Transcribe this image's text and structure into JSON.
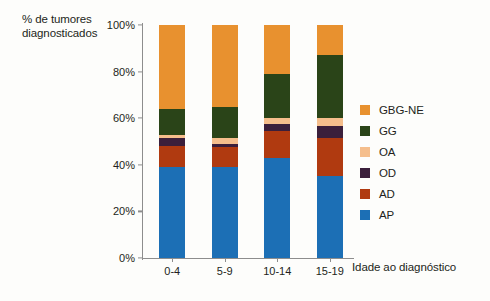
{
  "chart_data": {
    "type": "bar",
    "subtype": "stacked-100-percent",
    "title": "",
    "ylabel": "% de tumores diagnosticados",
    "xlabel": "Idade ao diagnóstico",
    "categories": [
      "0-4",
      "5-9",
      "10-14",
      "15-19"
    ],
    "ylim": [
      0,
      100
    ],
    "yticks": [
      "0%",
      "20%",
      "40%",
      "60%",
      "80%",
      "100%"
    ],
    "ytick_values": [
      0,
      20,
      40,
      60,
      80,
      100
    ],
    "grid": false,
    "legend_position": "right",
    "stack_order_bottom_to_top": [
      "AP",
      "AD",
      "OD",
      "OA",
      "GG",
      "GBG-NE"
    ],
    "series": [
      {
        "name": "AP",
        "color": "#1c6fb5",
        "values": [
          39,
          39,
          43,
          35
        ]
      },
      {
        "name": "AD",
        "color": "#b03a10",
        "values": [
          9,
          8.5,
          11.5,
          16.5
        ]
      },
      {
        "name": "OD",
        "color": "#3b1f3b",
        "values": [
          3.5,
          1.5,
          3,
          5
        ]
      },
      {
        "name": "OA",
        "color": "#f5be8c",
        "values": [
          1.5,
          2.5,
          2.5,
          3.5
        ]
      },
      {
        "name": "GG",
        "color": "#2a4418",
        "values": [
          11,
          13.5,
          19,
          27
        ]
      },
      {
        "name": "GBG-NE",
        "color": "#e8912f",
        "values": [
          36,
          35,
          21,
          13
        ]
      }
    ],
    "legend": [
      {
        "label": "GBG-NE",
        "color": "#e8912f"
      },
      {
        "label": "GG",
        "color": "#2a4418"
      },
      {
        "label": "OA",
        "color": "#f5be8c"
      },
      {
        "label": "OD",
        "color": "#3b1f3b"
      },
      {
        "label": "AD",
        "color": "#b03a10"
      },
      {
        "label": "AP",
        "color": "#1c6fb5"
      }
    ]
  },
  "axes": {
    "y_title": "% de tumores diagnosticados",
    "x_title": "Idade ao diagnóstico"
  }
}
